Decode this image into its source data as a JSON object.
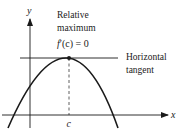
{
  "diagram": {
    "type": "calculus-illustration",
    "axes": {
      "x_label": "x",
      "y_label": "y"
    },
    "annotations": {
      "max_line1": "Relative",
      "max_line2": "maximum",
      "derivative_f": "f",
      "derivative_rest": "′(c) = 0",
      "tangent_line1": "Horizontal",
      "tangent_line2": "tangent",
      "point_label": "c"
    },
    "colors": {
      "ink": "#1a1a1a",
      "background": "#ffffff"
    }
  }
}
